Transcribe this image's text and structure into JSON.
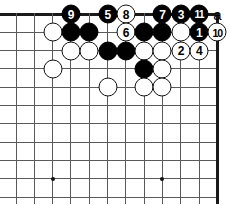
{
  "figure": {
    "kind": "go-board-diagram",
    "title": "",
    "width": 230,
    "height": 205
  },
  "board": {
    "origin_x": 16,
    "origin_y": 14,
    "spacing": 18.3,
    "cols": 12,
    "rows": 11,
    "edges": {
      "top": true,
      "right": true,
      "left": false,
      "bottom": false
    },
    "line_color": "#5a5a5a",
    "edge_color": "#1a1a1a",
    "background_color": "#ffffff",
    "star_points": [
      {
        "col": 2,
        "row": 9
      },
      {
        "col": 8,
        "row": 9
      }
    ]
  },
  "stones": [
    {
      "col": 2,
      "row": 1,
      "color": "white",
      "label": ""
    },
    {
      "col": 3,
      "row": 0,
      "color": "black",
      "label": "9"
    },
    {
      "col": 3,
      "row": 1,
      "color": "black",
      "label": ""
    },
    {
      "col": 3,
      "row": 2,
      "color": "white",
      "label": ""
    },
    {
      "col": 2,
      "row": 3,
      "color": "white",
      "label": ""
    },
    {
      "col": 4,
      "row": 1,
      "color": "black",
      "label": ""
    },
    {
      "col": 4,
      "row": 2,
      "color": "white",
      "label": ""
    },
    {
      "col": 5,
      "row": 0,
      "color": "black",
      "label": "5"
    },
    {
      "col": 5,
      "row": 2,
      "color": "black",
      "label": ""
    },
    {
      "col": 5,
      "row": 4,
      "color": "white",
      "label": ""
    },
    {
      "col": 6,
      "row": 0,
      "color": "white",
      "label": "8"
    },
    {
      "col": 6,
      "row": 1,
      "color": "white",
      "label": "6"
    },
    {
      "col": 6,
      "row": 2,
      "color": "black",
      "label": ""
    },
    {
      "col": 7,
      "row": 1,
      "color": "black",
      "label": ""
    },
    {
      "col": 7,
      "row": 2,
      "color": "white",
      "label": ""
    },
    {
      "col": 7,
      "row": 3,
      "color": "black",
      "label": ""
    },
    {
      "col": 7,
      "row": 4,
      "color": "white",
      "label": ""
    },
    {
      "col": 8,
      "row": 0,
      "color": "black",
      "label": "7"
    },
    {
      "col": 8,
      "row": 1,
      "color": "black",
      "label": ""
    },
    {
      "col": 8,
      "row": 2,
      "color": "white",
      "label": ""
    },
    {
      "col": 8,
      "row": 3,
      "color": "white",
      "label": ""
    },
    {
      "col": 8,
      "row": 4,
      "color": "white",
      "label": ""
    },
    {
      "col": 9,
      "row": 0,
      "color": "black",
      "label": "3"
    },
    {
      "col": 9,
      "row": 1,
      "color": "white",
      "label": ""
    },
    {
      "col": 9,
      "row": 2,
      "color": "white",
      "label": "2"
    },
    {
      "col": 10,
      "row": 0,
      "color": "black",
      "label": "11"
    },
    {
      "col": 10,
      "row": 1,
      "color": "black",
      "label": "1"
    },
    {
      "col": 10,
      "row": 2,
      "color": "white",
      "label": "4"
    },
    {
      "col": 11,
      "row": 1,
      "color": "white",
      "label": "10"
    }
  ],
  "point_labels": [
    {
      "col": 11,
      "row": 0,
      "text": "a"
    }
  ],
  "move_numbers": {
    "black": [
      "1",
      "3",
      "5",
      "7",
      "9",
      "11"
    ],
    "white": [
      "2",
      "4",
      "6",
      "8",
      "10"
    ],
    "sequence_length": 11
  }
}
